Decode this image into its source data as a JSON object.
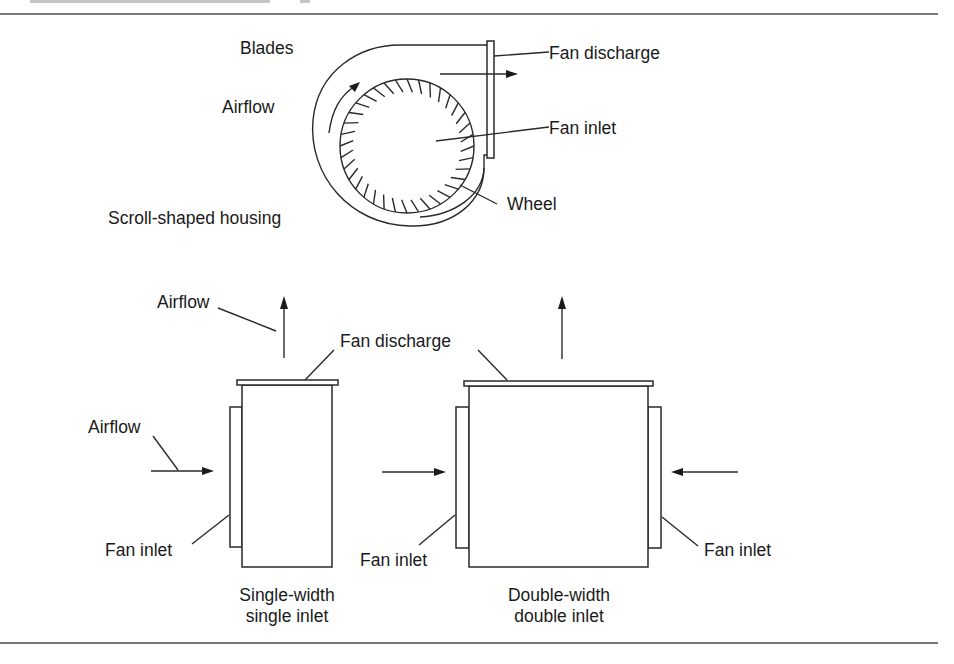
{
  "figure": {
    "caption_cutoff": "(text cut off at top edge of image)",
    "top_view": {
      "title": "Centrifugal fan cross-section",
      "labels": {
        "blades": "Blades",
        "airflow": "Airflow",
        "housing": "Scroll-shaped housing",
        "fan_discharge": "Fan discharge",
        "fan_inlet": "Fan inlet",
        "wheel": "Wheel"
      },
      "blade_count": 36
    },
    "single_width": {
      "labels": {
        "airflow_top": "Airflow",
        "airflow_side": "Airflow",
        "fan_inlet": "Fan inlet",
        "fan_discharge": "Fan discharge",
        "caption_line1": "Single-width",
        "caption_line2": "single inlet"
      }
    },
    "double_width": {
      "labels": {
        "fan_inlet_left": "Fan inlet",
        "fan_inlet_right": "Fan inlet",
        "caption_line1": "Double-width",
        "caption_line2": "double inlet"
      }
    }
  },
  "colors": {
    "line": "#2a2a2a",
    "text": "#1a1a1a",
    "background": "#ffffff"
  }
}
